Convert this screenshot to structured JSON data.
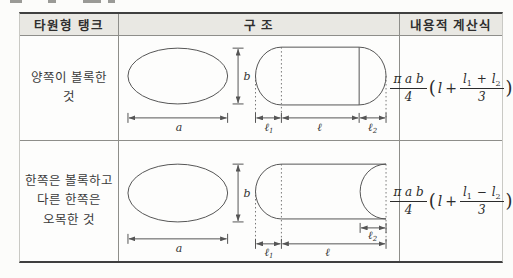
{
  "header": {
    "tank_type": "타원형 탱크",
    "structure": "구 조",
    "formula": "내용적 계산식"
  },
  "rows": [
    {
      "label_lines": [
        "양쪽이 볼록한 것"
      ],
      "diagram": {
        "a": "a",
        "b": "b",
        "l1_base": "ℓ",
        "l1_sub": "1",
        "l_mid": "ℓ",
        "l2_base": "ℓ",
        "l2_sub": "2"
      },
      "formula": {
        "coef_num": "π a b",
        "coef_den": "4",
        "open": "(",
        "var": "l",
        "plus": "+",
        "num_a": "l",
        "num_a_sub": "1",
        "num_op": "+",
        "num_b": "l",
        "num_b_sub": "2",
        "den": "3",
        "close": ")"
      }
    },
    {
      "label_lines": [
        "한쪽은 볼록하고",
        "다른 한쪽은",
        "오목한 것"
      ],
      "diagram": {
        "a": "a",
        "b": "b",
        "l1_base": "ℓ",
        "l1_sub": "1",
        "l_mid": "ℓ",
        "l2_base": "ℓ",
        "l2_sub": "2"
      },
      "formula": {
        "coef_num": "π a b",
        "coef_den": "4",
        "open": "(",
        "var": "l",
        "plus": "+",
        "num_a": "l",
        "num_a_sub": "1",
        "num_op": "−",
        "num_b": "l",
        "num_b_sub": "2",
        "den": "3",
        "close": ")"
      }
    }
  ],
  "colors": {
    "header_bg": "#e9e8e3",
    "border_dark": "#3f3f3f",
    "border_light": "#8e8e8a",
    "diagram_line": "#555555",
    "text": "#333333"
  }
}
